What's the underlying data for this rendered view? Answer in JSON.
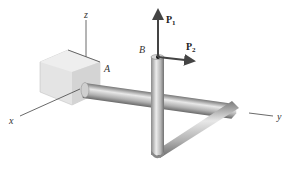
{
  "diagram": {
    "axes": {
      "x_label": "x",
      "y_label": "y",
      "z_label": "z"
    },
    "points": {
      "A": "A",
      "B": "B"
    },
    "forces": [
      {
        "name": "P",
        "subscript": "1",
        "direction": "+z"
      },
      {
        "name": "P",
        "subscript": "2",
        "direction": "+y"
      }
    ],
    "colors": {
      "rod_light": "#d9d9d9",
      "rod_mid": "#a8a8a8",
      "rod_dark": "#6e6e6e",
      "support": "#e6e6e6",
      "support_shadow": "#c9c9c9",
      "axis": "#444444",
      "arrow": "#444444"
    }
  }
}
